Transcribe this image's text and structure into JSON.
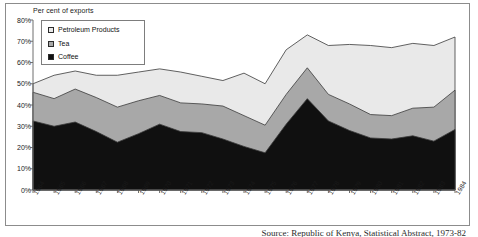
{
  "figure": {
    "y_axis_title": "Per cent of exports",
    "caption": "Source: Republic of Kenya, Statistical Abstract, 1973-82"
  },
  "legend": {
    "position": "top-left-inside",
    "items": [
      {
        "label": "Petroleum Products",
        "color": "#e9e9e9",
        "marker": "square-open"
      },
      {
        "label": "Tea",
        "color": "#a8a8a8",
        "marker": "square-grey"
      },
      {
        "label": "Coffee",
        "color": "#101010",
        "marker": "square-filled"
      }
    ]
  },
  "axes": {
    "y_ticks": [
      "0%",
      "10%",
      "20%",
      "30%",
      "40%",
      "50%",
      "60%",
      "70%",
      "80%"
    ],
    "x_ticks": [
      "1964",
      "1965",
      "1966",
      "1967",
      "1968",
      "1969",
      "1970",
      "1971",
      "1972",
      "1973",
      "1974",
      "1975",
      "1976",
      "1977",
      "1978",
      "1979",
      "1980",
      "1981",
      "1982",
      "1983",
      "1984"
    ]
  },
  "chart_data": {
    "type": "area",
    "stacked": true,
    "title": "",
    "subtitle": "",
    "xlabel": "",
    "ylabel": "Per cent of exports",
    "ylim": [
      0,
      80
    ],
    "grid": false,
    "legend_position": "top-left-inside",
    "categories": [
      "1964",
      "1965",
      "1966",
      "1967",
      "1968",
      "1969",
      "1970",
      "1971",
      "1972",
      "1973",
      "1974",
      "1975",
      "1976",
      "1977",
      "1978",
      "1979",
      "1980",
      "1981",
      "1982",
      "1983",
      "1984"
    ],
    "series": [
      {
        "name": "Coffee",
        "color": "#101010",
        "values": [
          32.5,
          30.0,
          32.0,
          27.5,
          22.5,
          26.5,
          31.0,
          27.5,
          27.0,
          24.0,
          20.5,
          17.5,
          31.0,
          43.0,
          32.5,
          28.0,
          24.5,
          24.0,
          25.5,
          23.0,
          28.5
        ]
      },
      {
        "name": "Tea",
        "color": "#a8a8a8",
        "values": [
          13.5,
          13.0,
          15.5,
          16.0,
          16.5,
          15.5,
          13.5,
          13.5,
          13.5,
          15.5,
          14.5,
          13.0,
          14.0,
          14.5,
          12.5,
          12.5,
          11.0,
          11.0,
          13.0,
          16.0,
          18.5
        ]
      },
      {
        "name": "Petroleum Products",
        "color": "#e9e9e9",
        "values": [
          4.0,
          11.0,
          8.5,
          10.5,
          15.0,
          13.5,
          12.5,
          14.5,
          13.0,
          12.0,
          20.0,
          19.5,
          21.0,
          15.5,
          23.0,
          28.0,
          32.5,
          32.0,
          30.5,
          29.0,
          25.0
        ]
      }
    ],
    "totals": [
      50.0,
      54.0,
      56.0,
      54.0,
      54.0,
      55.5,
      57.0,
      55.5,
      53.5,
      51.5,
      55.0,
      50.0,
      66.0,
      73.0,
      68.0,
      68.5,
      68.0,
      67.0,
      69.0,
      68.0,
      72.0
    ]
  }
}
